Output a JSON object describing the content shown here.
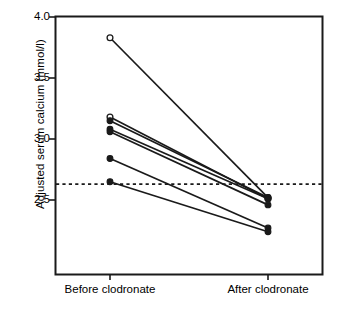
{
  "chart_data": {
    "type": "line",
    "title": "",
    "subtitle": "",
    "xlabel": "",
    "ylabel": "Adjusted serum calcium (mmol/l)",
    "categories": [
      "Before clodronate",
      "After clodronate"
    ],
    "x": [
      0,
      1
    ],
    "ylim": [
      2.13,
      4.0
    ],
    "xlim": [
      -0.45,
      1.45
    ],
    "y_ticks": [
      4.0,
      3.5,
      3.0,
      2.5
    ],
    "y_tick_labels": [
      "4.0",
      "3.5",
      "3.0",
      "2.5"
    ],
    "grid": false,
    "legend": false,
    "legend_position": "none",
    "annotations": [
      {
        "name": "upper-limit-of-normal",
        "type": "horizontal-reference-line",
        "value": 2.63,
        "style": "dashed",
        "label": ""
      }
    ],
    "marker_styles": {
      "open": "open-circle",
      "filled": "filled-circle"
    },
    "series": [
      {
        "name": "patient-1",
        "marker": "open",
        "values": [
          3.83,
          2.52
        ]
      },
      {
        "name": "patient-2",
        "marker": "open",
        "values": [
          3.18,
          2.51
        ]
      },
      {
        "name": "patient-3",
        "marker": "filled",
        "values": [
          3.15,
          2.52
        ]
      },
      {
        "name": "patient-4",
        "marker": "filled",
        "values": [
          3.08,
          2.51
        ]
      },
      {
        "name": "patient-5",
        "marker": "filled",
        "values": [
          3.06,
          2.46
        ]
      },
      {
        "name": "patient-6",
        "marker": "filled",
        "values": [
          2.84,
          2.27
        ]
      },
      {
        "name": "patient-7",
        "marker": "filled",
        "values": [
          2.65,
          2.24
        ]
      }
    ]
  },
  "axes": {
    "y_title": "Adjusted serum calcium (mmol/l)",
    "y_tick_labels": [
      "4.0",
      "3.5",
      "3.0",
      "2.5"
    ],
    "x_tick_labels": [
      "Before clodronate",
      "After clodronate"
    ]
  },
  "colors": {
    "line": "#1a1a1a",
    "frame": "#1a1a1a",
    "marker_fill": "#1a1a1a",
    "marker_open_fill": "#ffffff",
    "background": "#ffffff",
    "reference_line": "#1a1a1a"
  }
}
